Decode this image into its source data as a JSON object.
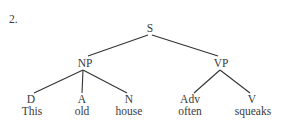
{
  "example_number": "2.",
  "tree": {
    "root": {
      "label": "S"
    },
    "np": {
      "label": "NP"
    },
    "vp": {
      "label": "VP"
    },
    "leaves": [
      {
        "category": "D",
        "word": "This"
      },
      {
        "category": "A",
        "word": "old"
      },
      {
        "category": "N",
        "word": "house"
      },
      {
        "category": "Adv",
        "word": "often"
      },
      {
        "category": "V",
        "word": "squeaks"
      }
    ]
  },
  "colors": {
    "text": "#3a3a3a",
    "edges": "#333333",
    "background": "#ffffff"
  }
}
